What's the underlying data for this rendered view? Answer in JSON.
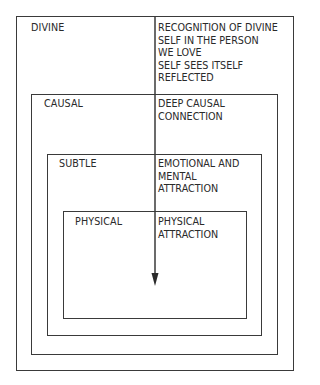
{
  "levels": [
    {
      "name": "DIVINE",
      "description": "RECOGNITION OF DIVINE\nSELF IN THE PERSON\nWE LOVE\nSELF SEES ITSELF\nREFLECTED"
    },
    {
      "name": "CAUSAL",
      "description": "DEEP CAUSAL\nCONNECTION"
    },
    {
      "name": "SUBTLE",
      "description": "EMOTIONAL AND\nMENTAL\nATTRACTION"
    },
    {
      "name": "PHYSICAL",
      "description": "PHYSICAL\nATTRACTION"
    }
  ],
  "arrow": {
    "direction": "down",
    "color": "#3a3a3a"
  }
}
